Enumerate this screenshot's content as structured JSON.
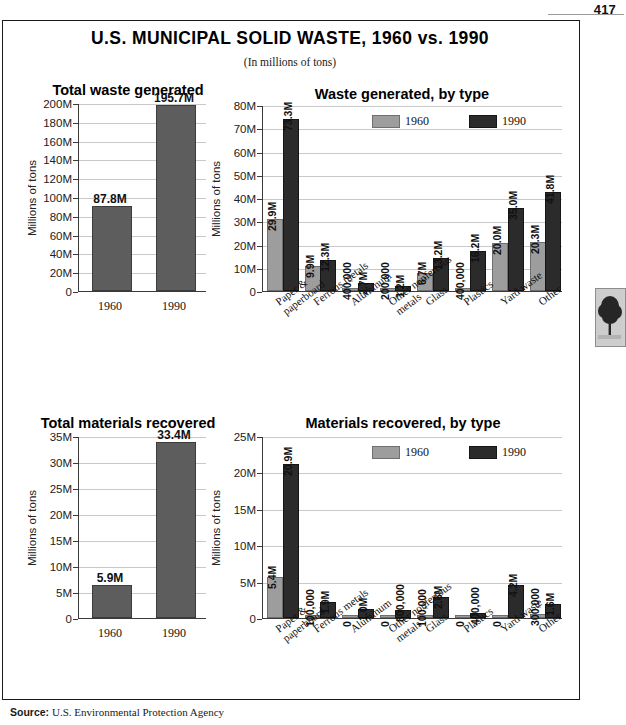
{
  "page": {
    "number": "417",
    "source_label": "Source:",
    "source_text": "U.S. Environmental Protection Agency",
    "tree_icon": "tree-thumbnail"
  },
  "header": {
    "title": "U.S. MUNICIPAL SOLID WASTE, 1960 vs. 1990",
    "subtitle": "(In millions of tons)"
  },
  "legend": {
    "items": [
      {
        "label": "1960",
        "color": "#9d9d9d"
      },
      {
        "label": "1990",
        "color": "#2b2b2b"
      }
    ]
  },
  "axis": {
    "ylabel": "Millions of tons"
  },
  "chart_data": [
    {
      "id": "total-waste-generated",
      "type": "bar",
      "title": "Total waste generated",
      "xlabel": "",
      "ylabel": "Millions of tons",
      "categories": [
        "1960",
        "1990"
      ],
      "values": [
        87.8,
        195.7
      ],
      "value_labels": [
        "87.8M",
        "195.7M"
      ],
      "ylim": [
        0,
        200
      ],
      "yticks": [
        0,
        20,
        40,
        60,
        80,
        100,
        120,
        140,
        160,
        180,
        200
      ],
      "ytick_labels": [
        "0",
        "20M",
        "40M",
        "60M",
        "80M",
        "100M",
        "120M",
        "140M",
        "160M",
        "180M",
        "200M"
      ],
      "grid": true,
      "bar_color": "#5d5d5d"
    },
    {
      "id": "waste-generated-by-type",
      "type": "bar",
      "title": "Waste generated, by type",
      "xlabel": "",
      "ylabel": "Millions of tons",
      "categories": [
        "Paper &\npaperboard",
        "Ferrous metals",
        "Aluminum",
        "Other nonferrous\nmetals",
        "Glass",
        "Plastics",
        "Yard waste",
        "Other"
      ],
      "series": [
        {
          "name": "1960",
          "color": "#9d9d9d",
          "values": [
            29.9,
            9.9,
            0.4,
            0.2,
            6.7,
            0.4,
            20.0,
            20.3
          ],
          "value_labels": [
            "29.9M",
            "9.9M",
            "400,000",
            "200,000",
            "6.7M",
            "400,000",
            "20.0M",
            "20.3M"
          ]
        },
        {
          "name": "1990",
          "color": "#2b2b2b",
          "values": [
            73.3,
            12.3,
            2.7,
            1.2,
            13.2,
            16.2,
            35.0,
            41.8
          ],
          "value_labels": [
            "73.3M",
            "12.3M",
            "2.7M",
            "1.2M",
            "13.2M",
            "16.2M",
            "35.0M",
            "41.8M"
          ]
        }
      ],
      "ylim": [
        0,
        80
      ],
      "yticks": [
        0,
        10,
        20,
        30,
        40,
        50,
        60,
        70,
        80
      ],
      "ytick_labels": [
        "0",
        "10M",
        "20M",
        "30M",
        "40M",
        "50M",
        "60M",
        "70M",
        "80M"
      ],
      "grid": true,
      "legend_position": "top-right"
    },
    {
      "id": "total-materials-recovered",
      "type": "bar",
      "title": "Total materials recovered",
      "xlabel": "",
      "ylabel": "Millions of tons",
      "categories": [
        "1960",
        "1990"
      ],
      "values": [
        5.9,
        33.4
      ],
      "value_labels": [
        "5.9M",
        "33.4M"
      ],
      "ylim": [
        0,
        35
      ],
      "yticks": [
        0,
        5,
        10,
        15,
        20,
        25,
        30,
        35
      ],
      "ytick_labels": [
        "0",
        "5M",
        "10M",
        "15M",
        "20M",
        "25M",
        "30M",
        "35M"
      ],
      "grid": true,
      "bar_color": "#5d5d5d"
    },
    {
      "id": "materials-recovered-by-type",
      "type": "bar",
      "title": "Materials recovered, by type",
      "xlabel": "",
      "ylabel": "Millions of tons",
      "categories": [
        "Paper &\npaperboard",
        "Ferrous metals",
        "Aluminum",
        "Other nonferrous\nmetals",
        "Glass",
        "Plastics",
        "Yard waste",
        "Other"
      ],
      "series": [
        {
          "name": "1960",
          "color": "#9d9d9d",
          "values": [
            5.4,
            0.1,
            0,
            0,
            0.1,
            0,
            0,
            0.3
          ],
          "value_labels": [
            "5.4M",
            "100,000",
            "0",
            "0",
            "100,000",
            "0",
            "0",
            "300,000"
          ]
        },
        {
          "name": "1990",
          "color": "#2b2b2b",
          "values": [
            20.9,
            1.9,
            1.0,
            0.8,
            2.6,
            0.4,
            4.2,
            1.6
          ],
          "value_labels": [
            "20.9M",
            "1.9M",
            "1.0M",
            "800,000",
            "2.6M",
            "400,000",
            "4.2M",
            "1.6M"
          ]
        }
      ],
      "ylim": [
        0,
        25
      ],
      "yticks": [
        0,
        5,
        10,
        15,
        20,
        25
      ],
      "ytick_labels": [
        "0",
        "5M",
        "10M",
        "15M",
        "20M",
        "25M"
      ],
      "grid": true,
      "legend_position": "top-right"
    }
  ]
}
